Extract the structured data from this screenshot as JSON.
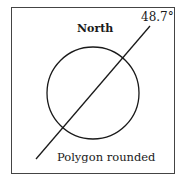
{
  "diagram": {
    "title": "North",
    "angle_label": "48.7°",
    "caption": "Polygon rounded",
    "stroke_color": "#1a1a1a",
    "circle": {
      "cx": 93,
      "cy": 93,
      "r": 46
    },
    "line": {
      "x1": 36,
      "y1": 159,
      "x2": 150,
      "y2": 26,
      "angle_deg": 48.7
    }
  }
}
